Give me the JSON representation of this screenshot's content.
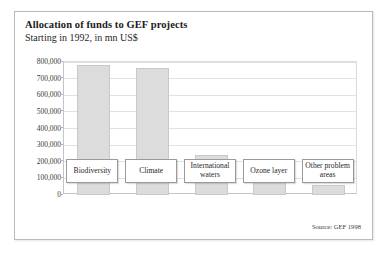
{
  "chart_data": {
    "type": "bar",
    "title": "Allocation of funds to GEF projects",
    "subtitle": "Starting in 1992, in mn US$",
    "xlabel": "",
    "ylabel": "",
    "categories": [
      "Biodiversity",
      "Climate",
      "International waters",
      "Ozone layer",
      "Other problem areas"
    ],
    "values": [
      780000,
      765000,
      240000,
      130000,
      58000
    ],
    "ylim": [
      0,
      800000
    ],
    "yticks": [
      0,
      100000,
      200000,
      300000,
      400000,
      500000,
      600000,
      700000,
      800000
    ],
    "ytick_labels": [
      "0",
      "100,000",
      "200,000",
      "300,000",
      "400,000",
      "500,000",
      "600,000",
      "700,000",
      "800,000"
    ],
    "grid": true,
    "legend": false,
    "source": "Source: GEF 1998",
    "bar_color": "#dcdcdc",
    "bar_border_color": "#c9c9c9",
    "grid_color": "#e2e2e2",
    "axis_color": "#c4c4c4"
  }
}
